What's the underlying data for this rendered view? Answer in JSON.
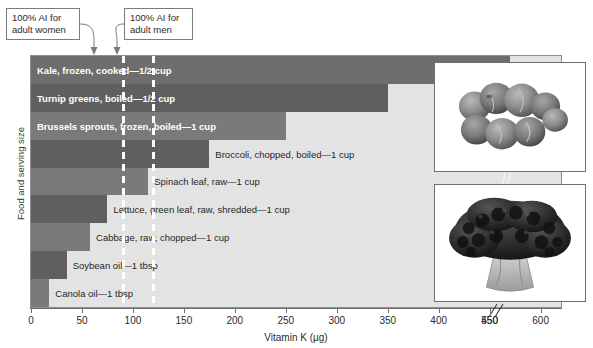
{
  "chart_data": {
    "type": "bar",
    "title": "",
    "xlabel": "Vitamin K (µg)",
    "ylabel": "Food and serving size",
    "orientation": "horizontal",
    "xlim": [
      0,
      620
    ],
    "xticks": [
      0,
      50,
      100,
      150,
      200,
      250,
      300,
      350,
      400,
      450,
      550,
      600
    ],
    "xtick_labels": [
      "0",
      "50",
      "100",
      "150",
      "200",
      "250",
      "300",
      "350",
      "400",
      "450",
      "550",
      "600"
    ],
    "axis_break": {
      "after": 450,
      "before": 550,
      "symbol": "//"
    },
    "grid": false,
    "legend": false,
    "categories": [
      "Kale, frozen, cooked—1/2 cup",
      "Turnip greens, boiled—1/2 cup",
      "Brussels sprouts, frozen, boiled—1 cup",
      "Broccoli, chopped, boiled—1 cup",
      "Spinach leaf, raw—1 cup",
      "Lettuce, green leaf, raw, shredded—1 cup",
      "Cabbage, raw, chopped—1 cup",
      "Soybean oil—1 tbsp",
      "Canola oil—1 tbsp"
    ],
    "values": [
      570,
      350,
      250,
      175,
      115,
      75,
      58,
      35,
      18
    ],
    "bars": [
      {
        "label": "Kale, frozen, cooked—1/2 cup",
        "value": 570,
        "label_position": "inside",
        "color": "#6e6e6e",
        "has_break": true
      },
      {
        "label": "Turnip greens, boiled—1/2 cup",
        "value": 350,
        "label_position": "inside",
        "color": "#5f5f5f",
        "has_break": false
      },
      {
        "label": "Brussels sprouts, frozen, boiled—1 cup",
        "value": 250,
        "label_position": "inside",
        "color": "#7a7a7a",
        "has_break": false
      },
      {
        "label": "Broccoli, chopped, boiled—1 cup",
        "value": 175,
        "label_position": "outside",
        "color": "#5f5f5f",
        "has_break": false
      },
      {
        "label": "Spinach leaf, raw—1 cup",
        "value": 115,
        "label_position": "outside",
        "color": "#7a7a7a",
        "has_break": false
      },
      {
        "label": "Lettuce, green leaf, raw, shredded—1 cup",
        "value": 75,
        "label_position": "outside",
        "color": "#5f5f5f",
        "has_break": false
      },
      {
        "label": "Cabbage, raw, chopped—1 cup",
        "value": 58,
        "label_position": "outside",
        "color": "#7a7a7a",
        "has_break": false
      },
      {
        "label": "Soybean oil—1 tbsp",
        "value": 35,
        "label_position": "outside",
        "color": "#5f5f5f",
        "has_break": false
      },
      {
        "label": "Canola oil—1 tbsp",
        "value": 18,
        "label_position": "outside",
        "color": "#7a7a7a",
        "has_break": false
      }
    ],
    "reference_lines": [
      {
        "name": "ai-adult-women",
        "value": 90,
        "label": "100% AI for\nadult women",
        "style": "dashed-white"
      },
      {
        "name": "ai-adult-men",
        "value": 120,
        "label": "100% AI for\nadult men",
        "style": "dashed-white"
      }
    ],
    "annotations": [
      {
        "name": "callout-women",
        "text": "100% AI for\nadult women"
      },
      {
        "name": "callout-men",
        "text": "100% AI for\nadult men"
      }
    ]
  },
  "callouts": {
    "women": "100% AI for\nadult women",
    "men": "100% AI for\nadult men"
  },
  "axes": {
    "x_title": "Vitamin K (µg)",
    "y_title": "Food and serving size"
  },
  "photos": [
    {
      "name": "brussels-sprouts-photo",
      "subject": "Brussels sprouts"
    },
    {
      "name": "broccoli-photo",
      "subject": "Broccoli head"
    }
  ]
}
